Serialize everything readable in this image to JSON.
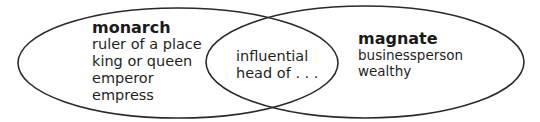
{
  "diagram": {
    "type": "venn",
    "stroke_color": "#2a2a2a",
    "left_set": {
      "title": "monarch",
      "items": [
        "ruler of a place",
        "king or queen",
        "emperor",
        "empress"
      ]
    },
    "right_set": {
      "title": "magnate",
      "items": [
        "businessperson",
        "wealthy"
      ]
    },
    "intersection": {
      "items": [
        "influential",
        "head of . . ."
      ]
    }
  }
}
